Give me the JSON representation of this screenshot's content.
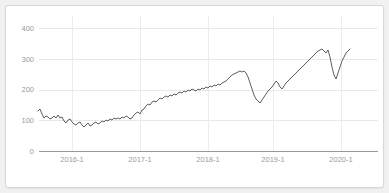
{
  "card": {
    "background_color": "#ffffff",
    "border_color": "#d8d8d8"
  },
  "page": {
    "background_color": "#f1f1f1"
  },
  "chart_data": {
    "type": "line",
    "title": "",
    "subtitle": "",
    "xlabel": "",
    "ylabel": "",
    "grid": true,
    "legend": "none",
    "line_color": "#4c4c4c",
    "grid_color": "#e9e9e9",
    "axis_color": "#9a9a9a",
    "tick_label_color": "#9b9b9b",
    "ylim": [
      0,
      420
    ],
    "yticks": [
      0,
      100,
      200,
      300,
      400
    ],
    "ytick_labels": [
      "0",
      "100",
      "200",
      "300",
      "400"
    ],
    "xticks": [
      "2016-1",
      "2017-1",
      "2018-1",
      "2019-1",
      "2020-1"
    ],
    "xtick_labels": [
      "2016-1",
      "2017-1",
      "2018-1",
      "2019-1",
      "2020-1"
    ],
    "xlim": [
      "2015-08",
      "2020-10"
    ],
    "series": [
      {
        "name": "price",
        "x": [
          "2015-08",
          "2015-09",
          "2015-10",
          "2015-11",
          "2015-12",
          "2016-01",
          "2016-02",
          "2016-03",
          "2016-04",
          "2016-05",
          "2016-06",
          "2016-07",
          "2016-08",
          "2016-09",
          "2016-10",
          "2016-11",
          "2016-12",
          "2017-01",
          "2017-02",
          "2017-03",
          "2017-04",
          "2017-05",
          "2017-06",
          "2017-07",
          "2017-08",
          "2017-09",
          "2017-10",
          "2017-11",
          "2017-12",
          "2018-01",
          "2018-02",
          "2018-03",
          "2018-04",
          "2018-05",
          "2018-06",
          "2018-07",
          "2018-08",
          "2018-09",
          "2018-10",
          "2018-11",
          "2018-12",
          "2019-01",
          "2019-02",
          "2019-03",
          "2019-04",
          "2019-05",
          "2019-06",
          "2019-07",
          "2019-08",
          "2019-09",
          "2019-10",
          "2019-11",
          "2019-12",
          "2020-01",
          "2020-02",
          "2020-03",
          "2020-04",
          "2020-05",
          "2020-06",
          "2020-07",
          "2020-08",
          "2020-09"
        ],
        "values": [
          126,
          122,
          112,
          114,
          118,
          112,
          104,
          98,
          100,
          108,
          104,
          96,
          98,
          104,
          100,
          104,
          110,
          112,
          126,
          140,
          148,
          158,
          152,
          156,
          164,
          160,
          168,
          172,
          176,
          174,
          168,
          178,
          176,
          186,
          182,
          190,
          204,
          218,
          224,
          212,
          168,
          152,
          156,
          166,
          178,
          196,
          186,
          208,
          200,
          206,
          216,
          232,
          248,
          268,
          296,
          320,
          244,
          268,
          300,
          312,
          322,
          325
        ],
        "raw_points": [
          [
            38,
            110
          ],
          [
            40,
            108
          ],
          [
            42,
            113
          ],
          [
            44,
            117
          ],
          [
            46,
            115
          ],
          [
            48,
            116
          ],
          [
            50,
            118
          ],
          [
            52,
            117
          ],
          [
            54,
            115
          ],
          [
            56,
            117
          ],
          [
            58,
            114
          ],
          [
            60,
            117
          ],
          [
            62,
            116
          ],
          [
            64,
            120
          ],
          [
            66,
            122
          ],
          [
            68,
            119
          ],
          [
            70,
            118
          ],
          [
            72,
            121
          ],
          [
            74,
            123
          ],
          [
            76,
            124
          ],
          [
            78,
            122
          ],
          [
            80,
            121
          ],
          [
            82,
            124
          ],
          [
            84,
            126
          ],
          [
            86,
            124
          ],
          [
            88,
            122
          ],
          [
            90,
            125
          ],
          [
            92,
            124
          ],
          [
            94,
            122
          ],
          [
            96,
            121
          ],
          [
            98,
            123
          ],
          [
            100,
            122
          ],
          [
            102,
            120
          ],
          [
            104,
            121
          ],
          [
            106,
            119
          ],
          [
            108,
            120
          ],
          [
            110,
            118
          ],
          [
            112,
            119
          ],
          [
            114,
            117
          ],
          [
            116,
            118
          ],
          [
            118,
            117
          ],
          [
            120,
            118
          ],
          [
            122,
            116
          ],
          [
            124,
            117
          ],
          [
            126,
            115
          ],
          [
            128,
            116
          ],
          [
            130,
            118
          ],
          [
            132,
            117
          ],
          [
            134,
            114
          ],
          [
            136,
            112
          ],
          [
            138,
            111
          ],
          [
            140,
            113
          ],
          [
            142,
            109
          ],
          [
            144,
            108
          ],
          [
            146,
            105
          ],
          [
            148,
            103
          ],
          [
            150,
            104
          ],
          [
            152,
            101
          ],
          [
            154,
            100
          ],
          [
            156,
            101
          ],
          [
            158,
            99
          ],
          [
            160,
            97
          ],
          [
            162,
            98
          ],
          [
            164,
            96
          ],
          [
            166,
            95
          ],
          [
            168,
            96
          ],
          [
            170,
            94
          ],
          [
            172,
            95
          ],
          [
            174,
            93
          ],
          [
            176,
            94
          ],
          [
            178,
            92
          ],
          [
            180,
            91
          ],
          [
            182,
            92
          ],
          [
            184,
            90
          ],
          [
            186,
            91
          ],
          [
            188,
            89
          ],
          [
            190,
            90
          ],
          [
            192,
            88
          ],
          [
            194,
            89
          ],
          [
            196,
            90
          ],
          [
            198,
            88
          ],
          [
            200,
            89
          ],
          [
            202,
            87
          ],
          [
            204,
            88
          ],
          [
            206,
            86
          ],
          [
            208,
            87
          ],
          [
            210,
            85
          ],
          [
            212,
            86
          ],
          [
            214,
            84
          ],
          [
            216,
            85
          ],
          [
            218,
            83
          ],
          [
            220,
            84
          ],
          [
            222,
            82
          ],
          [
            224,
            81
          ],
          [
            226,
            80
          ],
          [
            228,
            78
          ],
          [
            230,
            76
          ],
          [
            232,
            74
          ],
          [
            234,
            73
          ],
          [
            236,
            72
          ],
          [
            238,
            71
          ],
          [
            240,
            70
          ],
          [
            242,
            71
          ],
          [
            244,
            70
          ],
          [
            246,
            72
          ],
          [
            248,
            76
          ],
          [
            250,
            82
          ],
          [
            252,
            88
          ],
          [
            254,
            94
          ],
          [
            256,
            98
          ],
          [
            258,
            100
          ],
          [
            260,
            102
          ],
          [
            262,
            99
          ],
          [
            264,
            96
          ],
          [
            266,
            93
          ],
          [
            268,
            90
          ],
          [
            270,
            88
          ],
          [
            272,
            86
          ],
          [
            274,
            83
          ],
          [
            276,
            80
          ],
          [
            278,
            82
          ],
          [
            280,
            86
          ],
          [
            282,
            88
          ],
          [
            284,
            85
          ],
          [
            286,
            82
          ],
          [
            288,
            80
          ],
          [
            290,
            78
          ],
          [
            292,
            76
          ],
          [
            294,
            74
          ],
          [
            296,
            72
          ],
          [
            298,
            70
          ],
          [
            300,
            68
          ],
          [
            302,
            66
          ],
          [
            304,
            64
          ],
          [
            306,
            62
          ],
          [
            308,
            60
          ],
          [
            310,
            58
          ],
          [
            312,
            56
          ],
          [
            314,
            54
          ],
          [
            316,
            52
          ],
          [
            318,
            50
          ],
          [
            320,
            49
          ],
          [
            322,
            48
          ],
          [
            324,
            50
          ],
          [
            326,
            52
          ],
          [
            328,
            49
          ],
          [
            330,
            56
          ],
          [
            332,
            66
          ],
          [
            334,
            74
          ],
          [
            336,
            78
          ],
          [
            338,
            72
          ],
          [
            340,
            66
          ],
          [
            342,
            60
          ],
          [
            344,
            56
          ],
          [
            346,
            52
          ],
          [
            348,
            50
          ],
          [
            350,
            48
          ]
        ]
      }
    ]
  }
}
